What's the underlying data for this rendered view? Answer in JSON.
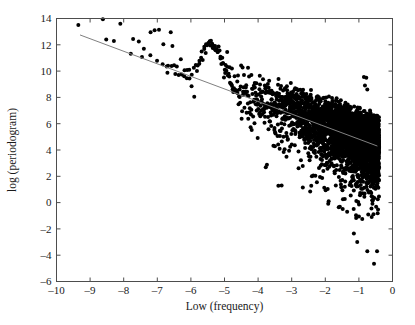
{
  "chart_data": {
    "type": "scatter",
    "title": "",
    "xlabel": "Low (frequency)",
    "ylabel": "log (periodogram)",
    "xlim": [
      -10,
      0
    ],
    "ylim": [
      -6,
      14
    ],
    "xticks": [
      "–10",
      "–9",
      "–8",
      "–7",
      "–6",
      "–5",
      "–4",
      "–3",
      "–2",
      "–1",
      "0"
    ],
    "xtick_values": [
      -10,
      -9,
      -8,
      -7,
      -6,
      -5,
      -4,
      -3,
      -2,
      -1,
      0
    ],
    "yticks": [
      "–6",
      "–4",
      "–2",
      "0",
      "2",
      "4",
      "6",
      "8",
      "10",
      "12",
      "14"
    ],
    "ytick_values": [
      -6,
      -4,
      -2,
      0,
      2,
      4,
      6,
      8,
      10,
      12,
      14
    ],
    "grid": false,
    "legend": null,
    "marker": "filled-circle",
    "marker_color": "#000000",
    "marker_size": 2.0,
    "point_count_approx": 4096,
    "data_x_range": [
      -9.35,
      -0.4
    ],
    "series": [
      {
        "name": "periodogram",
        "description": "log periodogram of a long-memory series plotted against log frequency; density increases sharply toward high frequency (right), with a narrow sparse ridge at low frequency (left) and a pronounced spectral hump near x = -5.4",
        "trend": "decreasing",
        "sparse_points": [
          [
            -9.35,
            13.5
          ],
          [
            -8.62,
            13.95
          ],
          [
            -8.52,
            12.4
          ],
          [
            -8.1,
            13.6
          ],
          [
            -7.72,
            12.45
          ],
          [
            -7.55,
            12.25
          ],
          [
            -7.4,
            11.7
          ],
          [
            -7.2,
            12.95
          ],
          [
            -7.08,
            13.1
          ],
          [
            -6.95,
            13.15
          ],
          [
            -6.82,
            12.05
          ],
          [
            -6.72,
            10.35
          ],
          [
            -6.68,
            10.4
          ],
          [
            -6.6,
            12.95
          ],
          [
            -6.55,
            11.9
          ],
          [
            -6.5,
            10.45
          ],
          [
            -6.42,
            10.35
          ],
          [
            -6.3,
            10.9
          ],
          [
            -6.2,
            9.6
          ],
          [
            -6.12,
            9.45
          ],
          [
            -6.05,
            10.1
          ],
          [
            -5.98,
            8.85
          ],
          [
            -5.9,
            8.05
          ],
          [
            -5.82,
            10.0
          ],
          [
            -5.75,
            10.55
          ],
          [
            -5.68,
            11.5
          ],
          [
            -5.6,
            11.85
          ],
          [
            -5.55,
            12.05
          ],
          [
            -5.48,
            12.1
          ],
          [
            -5.42,
            11.95
          ],
          [
            -5.35,
            11.75
          ],
          [
            -5.28,
            11.9
          ],
          [
            -5.2,
            11.45
          ],
          [
            -5.12,
            11.1
          ],
          [
            -5.05,
            10.6
          ],
          [
            -4.98,
            9.85
          ],
          [
            -4.92,
            11.45
          ],
          [
            -4.85,
            10.3
          ],
          [
            -4.78,
            10.2
          ],
          [
            -4.7,
            9.6
          ],
          [
            -4.62,
            9.2
          ],
          [
            -4.55,
            8.6
          ],
          [
            -4.45,
            8.2
          ],
          [
            -4.3,
            10.25
          ],
          [
            -4.2,
            9.7
          ],
          [
            -4.1,
            9.1
          ],
          [
            -3.95,
            9.65
          ],
          [
            -3.8,
            8.9
          ],
          [
            -3.6,
            8.5
          ],
          [
            -3.4,
            8.25
          ],
          [
            -3.2,
            8.7
          ],
          [
            -3.0,
            8.3
          ],
          [
            -2.6,
            8.05
          ],
          [
            -2.2,
            7.9
          ],
          [
            -1.8,
            7.95
          ],
          [
            -1.4,
            7.6
          ],
          [
            -0.85,
            9.55
          ],
          [
            -0.78,
            9.5
          ],
          [
            -0.82,
            8.9
          ],
          [
            -0.75,
            8.6
          ]
        ],
        "low_outliers": [
          [
            -3.3,
            1.3
          ],
          [
            -2.45,
            0.85
          ],
          [
            -2.25,
            1.55
          ],
          [
            -1.9,
            0.1
          ],
          [
            -1.6,
            -0.35
          ],
          [
            -1.35,
            -0.7
          ],
          [
            -1.15,
            -2.35
          ],
          [
            -1.05,
            -3.0
          ],
          [
            -0.9,
            -1.25
          ],
          [
            -0.75,
            -3.7
          ],
          [
            -0.55,
            -4.65
          ],
          [
            -0.62,
            -1.1
          ]
        ]
      }
    ],
    "fit_line": {
      "name": "regression fit",
      "color": "#808080",
      "width": 1,
      "x": [
        -9.3,
        -0.45
      ],
      "y": [
        12.75,
        4.3
      ],
      "slope": -0.955,
      "intercept": 3.87
    },
    "axes_style": {
      "spines": [
        "left",
        "right",
        "top",
        "bottom"
      ],
      "tick_direction": "in",
      "spine_color": "#4d4d4d",
      "background": "#ffffff"
    }
  }
}
